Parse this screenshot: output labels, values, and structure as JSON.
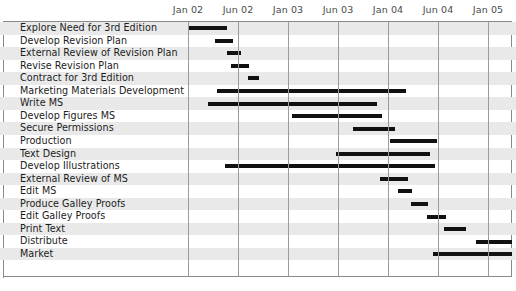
{
  "chart_data": {
    "type": "bar",
    "chart_subtype": "gantt",
    "title": "",
    "xlabel": "",
    "ylabel": "",
    "grid": true,
    "legend": null,
    "axis": {
      "tick_labels": [
        "Jan 02",
        "Jun 02",
        "Jan 03",
        "Jun 03",
        "Jan 04",
        "Jun 04",
        "Jan 05"
      ],
      "tick_x_px": [
        188,
        238,
        288,
        338,
        388,
        438,
        488
      ],
      "px_per_tick": 50,
      "months_per_tick": 5,
      "xlim_px": [
        3,
        512
      ]
    },
    "categories": [
      "Explore Need for 3rd Edition",
      "Develop Revision Plan",
      "External Review of Revision Plan",
      "Revise Revision Plan",
      "Contract for 3rd Edition",
      "Marketing Materials Development",
      "Write MS",
      "Develop Figures MS",
      "Secure Permissions",
      "Production",
      "Text Design",
      "Develop Illustrations",
      "External Review of MS",
      "Edit MS",
      "Produce Galley Proofs",
      "Edit Galley Proofs",
      "Print Text",
      "Distribute",
      "Market"
    ],
    "tasks": [
      {
        "name": "Explore Need for 3rd Edition",
        "start_px": 188,
        "end_px": 227,
        "start_label": "Jan 02",
        "end_label": "Apr 02"
      },
      {
        "name": "Develop Revision Plan",
        "start_px": 215,
        "end_px": 233,
        "start_label": "Mar 02",
        "end_label": "May 02"
      },
      {
        "name": "External Review of Revision Plan",
        "start_px": 227,
        "end_px": 241,
        "start_label": "Apr 02",
        "end_label": "Jun 02"
      },
      {
        "name": "Revise Revision Plan",
        "start_px": 231,
        "end_px": 249,
        "start_label": "May 02",
        "end_label": "Jul 02"
      },
      {
        "name": "Contract for 3rd Edition",
        "start_px": 248,
        "end_px": 259,
        "start_label": "Jul 02",
        "end_label": "Aug 02"
      },
      {
        "name": "Marketing Materials Development",
        "start_px": 217,
        "end_px": 406,
        "start_label": "Mar 02",
        "end_label": "Jul 04"
      },
      {
        "name": "Write MS",
        "start_px": 208,
        "end_px": 377,
        "start_label": "Feb 02",
        "end_label": "Oct 03"
      },
      {
        "name": "Develop Figures MS",
        "start_px": 292,
        "end_px": 382,
        "start_label": "Feb 03",
        "end_label": "Nov 03"
      },
      {
        "name": "Secure Permissions",
        "start_px": 353,
        "end_px": 395,
        "start_label": "Aug 03",
        "end_label": "Jan 04"
      },
      {
        "name": "Production",
        "start_px": 390,
        "end_px": 437,
        "start_label": "Dec 03",
        "end_label": "Jun 04"
      },
      {
        "name": "Text Design",
        "start_px": 336,
        "end_px": 430,
        "start_label": "Jun 03",
        "end_label": "May 04"
      },
      {
        "name": "Develop Illustrations",
        "start_px": 225,
        "end_px": 435,
        "start_label": "Apr 02",
        "end_label": "Jun 04"
      },
      {
        "name": "External Review of MS",
        "start_px": 380,
        "end_px": 408,
        "start_label": "Nov 03",
        "end_label": "Feb 04"
      },
      {
        "name": "Edit MS",
        "start_px": 398,
        "end_px": 412,
        "start_label": "Jan 04",
        "end_label": "Mar 04"
      },
      {
        "name": "Produce Galley Proofs",
        "start_px": 411,
        "end_px": 428,
        "start_label": "Mar 04",
        "end_label": "May 04"
      },
      {
        "name": "Edit Galley Proofs",
        "start_px": 427,
        "end_px": 446,
        "start_label": "May 04",
        "end_label": "Jul 04"
      },
      {
        "name": "Print Text",
        "start_px": 444,
        "end_px": 466,
        "start_label": "Jul 04",
        "end_label": "Sep 04"
      },
      {
        "name": "Distribute",
        "start_px": 476,
        "end_px": 512,
        "start_label": "Oct 04",
        "end_label": "Jan 05"
      },
      {
        "name": "Market",
        "start_px": 433,
        "end_px": 512,
        "start_label": "Jun 04",
        "end_label": "Jan 05"
      }
    ],
    "colors": {
      "bar": "#111111",
      "stripe": "#e9e9e9",
      "gridline": "#9b9b9b",
      "border": "#8a8a8a",
      "label_text": "#1c1c1c",
      "axis_text": "#4a4a4a",
      "background": "#ffffff"
    }
  }
}
